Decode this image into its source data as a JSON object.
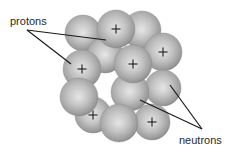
{
  "labels": {
    "protons": "protons",
    "neutrons": "neutrons"
  },
  "colors": {
    "sphere_highlight": "#e6e6e6",
    "sphere_mid": "#b4b4b4",
    "sphere_shadow": "#7a7a7a",
    "plus_sign": "#1a1a1a",
    "pointer_line": "#1a1a1a",
    "text": "#2a2a2a",
    "background": "#ffffff"
  },
  "plus_symbol": "+",
  "spheres": [
    {
      "id": "back-top-left",
      "type": "neutron",
      "cx": 83,
      "cy": 33,
      "r": 18
    },
    {
      "id": "back-top-right",
      "type": "neutron",
      "cx": 142,
      "cy": 30,
      "r": 19
    },
    {
      "id": "back-middle",
      "type": "neutron",
      "cx": 105,
      "cy": 55,
      "r": 18
    },
    {
      "id": "top",
      "type": "proton",
      "cx": 116,
      "cy": 29,
      "r": 19
    },
    {
      "id": "right",
      "type": "proton",
      "cx": 163,
      "cy": 52,
      "r": 19
    },
    {
      "id": "right-lower",
      "type": "neutron",
      "cx": 163,
      "cy": 88,
      "r": 18
    },
    {
      "id": "bottom-left",
      "type": "proton",
      "cx": 93,
      "cy": 115,
      "r": 18
    },
    {
      "id": "left",
      "type": "proton",
      "cx": 82,
      "cy": 69,
      "r": 19
    },
    {
      "id": "center-lower",
      "type": "neutron",
      "cx": 130,
      "cy": 92,
      "r": 19
    },
    {
      "id": "center",
      "type": "proton",
      "cx": 133,
      "cy": 64,
      "r": 19
    },
    {
      "id": "left-lower",
      "type": "neutron",
      "cx": 79,
      "cy": 97,
      "r": 19
    },
    {
      "id": "bottom-right",
      "type": "proton",
      "cx": 152,
      "cy": 122,
      "r": 18
    },
    {
      "id": "bottom-center",
      "type": "neutron",
      "cx": 119,
      "cy": 123,
      "r": 19
    }
  ],
  "pointers": {
    "protons": [
      {
        "x1": 27,
        "y1": 30,
        "x2": 106,
        "y2": 40
      },
      {
        "x1": 27,
        "y1": 30,
        "x2": 71,
        "y2": 64
      }
    ],
    "neutrons": [
      {
        "x1": 202,
        "y1": 129,
        "x2": 140,
        "y2": 100
      },
      {
        "x1": 202,
        "y1": 129,
        "x2": 170,
        "y2": 85
      }
    ]
  }
}
